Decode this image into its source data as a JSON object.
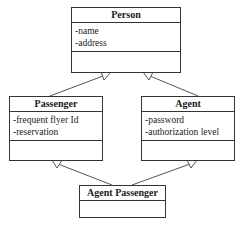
{
  "classes": {
    "person": {
      "name": "Person",
      "attributes": [
        "-name",
        "-address"
      ],
      "methods": []
    },
    "passenger": {
      "name": "Passenger",
      "attributes": [
        "-frequent flyer Id",
        "-reservation"
      ],
      "methods": []
    },
    "agent": {
      "name": "Agent",
      "attributes": [
        "-password",
        "-authorization level"
      ],
      "methods": []
    },
    "agent_passenger": {
      "name": "Agent Passenger",
      "attributes": [],
      "methods": []
    }
  },
  "relationships": [
    {
      "type": "generalization",
      "from": "Passenger",
      "to": "Person"
    },
    {
      "type": "generalization",
      "from": "Agent",
      "to": "Person"
    },
    {
      "type": "generalization",
      "from": "Agent Passenger",
      "to": "Passenger"
    },
    {
      "type": "generalization",
      "from": "Agent Passenger",
      "to": "Agent"
    }
  ]
}
